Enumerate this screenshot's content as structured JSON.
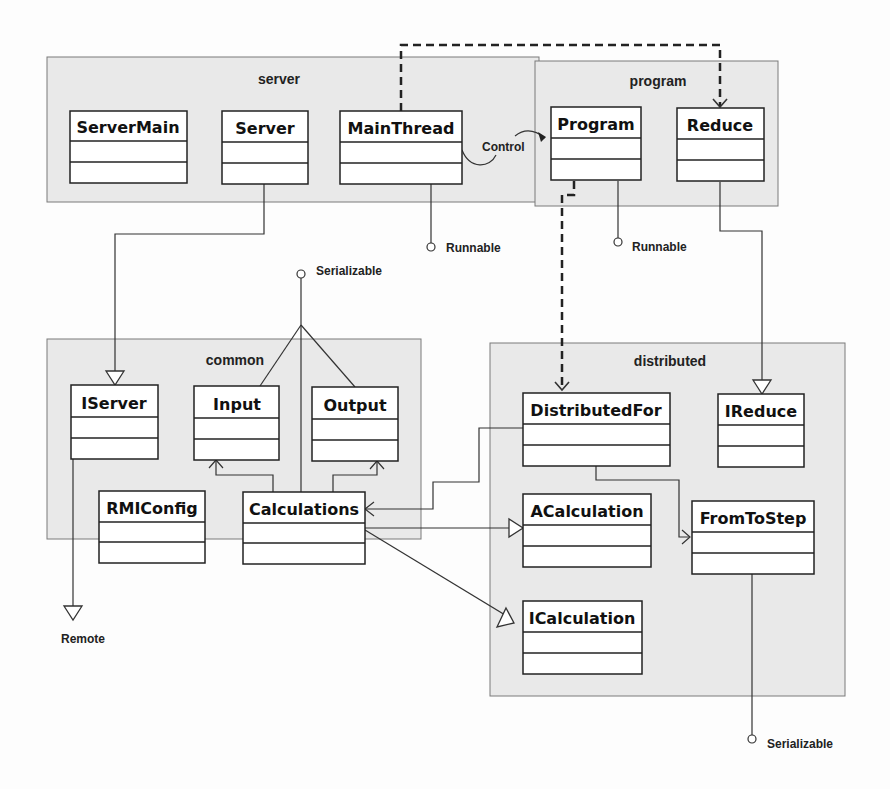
{
  "diagram": {
    "type": "UML class diagram",
    "packages": [
      {
        "id": "server",
        "title": "server"
      },
      {
        "id": "program",
        "title": "program"
      },
      {
        "id": "common",
        "title": "common"
      },
      {
        "id": "distributed",
        "title": "distributed"
      }
    ],
    "classes": {
      "ServerMain": "ServerMain",
      "Server": "Server",
      "MainThread": "MainThread",
      "Program": "Program",
      "Reduce": "Reduce",
      "IServer": "IServer",
      "Input": "Input",
      "Output": "Output",
      "RMIConfig": "RMIConfig",
      "Calculations": "Calculations",
      "DistributedFor": "DistributedFor",
      "IReduce": "IReduce",
      "ACalculation": "ACalculation",
      "FromToStep": "FromToStep",
      "ICalculation": "ICalculation"
    },
    "interfaces": {
      "runnable1": "Runnable",
      "runnable2": "Runnable",
      "serializable1": "Serializable",
      "serializable2": "Serializable",
      "remote": "Remote"
    },
    "labels": {
      "control": "Control"
    },
    "relations": [
      {
        "from": "MainThread",
        "to": "Reduce",
        "kind": "dependency (dashed)"
      },
      {
        "from": "MainThread",
        "to": "Program",
        "kind": "association",
        "label": "Control"
      },
      {
        "from": "Program",
        "to": "DistributedFor",
        "kind": "dependency (dashed)"
      },
      {
        "from": "MainThread",
        "to": "Runnable",
        "kind": "implements (lollipop)"
      },
      {
        "from": "Program",
        "to": "Runnable",
        "kind": "implements (lollipop)"
      },
      {
        "from": "Server",
        "to": "IServer",
        "kind": "realization"
      },
      {
        "from": "Reduce",
        "to": "IReduce",
        "kind": "realization"
      },
      {
        "from": "IServer",
        "to": "Remote",
        "kind": "generalization"
      },
      {
        "from": "Input",
        "to": "Serializable",
        "kind": "implements"
      },
      {
        "from": "Output",
        "to": "Serializable",
        "kind": "implements"
      },
      {
        "from": "Calculations",
        "to": "Serializable",
        "kind": "implements"
      },
      {
        "from": "Calculations",
        "to": "Input",
        "kind": "association"
      },
      {
        "from": "Calculations",
        "to": "Output",
        "kind": "association"
      },
      {
        "from": "DistributedFor",
        "to": "Calculations",
        "kind": "association"
      },
      {
        "from": "DistributedFor",
        "to": "FromToStep",
        "kind": "association"
      },
      {
        "from": "Calculations",
        "to": "ACalculation",
        "kind": "generalization"
      },
      {
        "from": "Calculations",
        "to": "ICalculation",
        "kind": "realization"
      },
      {
        "from": "FromToStep",
        "to": "Serializable",
        "kind": "implements (lollipop)"
      }
    ]
  }
}
